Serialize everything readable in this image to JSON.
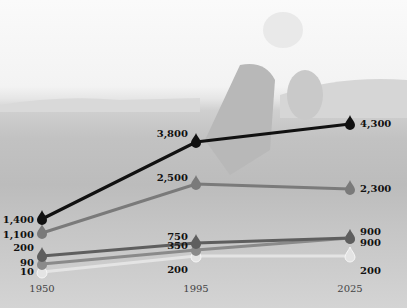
{
  "chart_data": {
    "type": "line",
    "title": "",
    "xlabel": "",
    "ylabel": "",
    "x": [
      "1950",
      "1995",
      "2025"
    ],
    "series": [
      {
        "name": "series-1",
        "color": "#111111",
        "values": [
          1400,
          3800,
          4300
        ],
        "labels": [
          "1,400",
          "3,800",
          "4,300"
        ]
      },
      {
        "name": "series-2",
        "color": "#7a7a7a",
        "values": [
          1100,
          2500,
          2300
        ],
        "labels": [
          "1,100",
          "2,500",
          "2,300"
        ]
      },
      {
        "name": "series-3",
        "color": "#5e5e5e",
        "values": [
          200,
          750,
          900
        ],
        "labels": [
          "200",
          "750",
          "900"
        ]
      },
      {
        "name": "series-4",
        "color": "#8a8a8a",
        "values": [
          90,
          350,
          900
        ],
        "labels": [
          "90",
          "350",
          "900"
        ]
      },
      {
        "name": "series-5",
        "color": "#e4e4e4",
        "values": [
          10,
          200,
          200
        ],
        "labels": [
          "10",
          "200",
          "200"
        ]
      }
    ],
    "grid": false,
    "legend": "none",
    "marker": "water-drop"
  },
  "axis": {
    "x_ticks": [
      "1950",
      "1995",
      "2025"
    ]
  }
}
